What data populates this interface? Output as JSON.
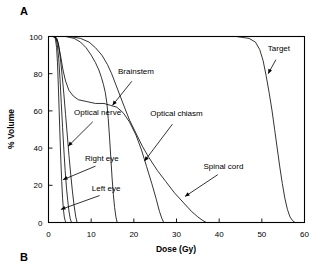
{
  "figure": {
    "panel_a_label": "A",
    "panel_b_label": "B"
  },
  "chart_data": {
    "type": "line",
    "title": "",
    "xlabel": "Dose (Gy)",
    "ylabel": "% Volume",
    "xlim": [
      0,
      60
    ],
    "ylim": [
      0,
      100
    ],
    "xticks": [
      0,
      10,
      20,
      30,
      40,
      50,
      60
    ],
    "yticks": [
      0,
      20,
      40,
      60,
      80,
      100
    ],
    "grid": false,
    "legend_position": "inline-annotations",
    "annotations": [
      {
        "label": "Target",
        "x": 54.0,
        "y": 92
      },
      {
        "label": "Brainstem",
        "x": 20.5,
        "y": 80
      },
      {
        "label": "Optical chiasm",
        "x": 30.0,
        "y": 57
      },
      {
        "label": "Optical nerve",
        "x": 11.5,
        "y": 58
      },
      {
        "label": "Right eye",
        "x": 12.5,
        "y": 33
      },
      {
        "label": "Left eye",
        "x": 13.5,
        "y": 17
      },
      {
        "label": "Spinal cord",
        "x": 41.0,
        "y": 29
      }
    ],
    "series": [
      {
        "name": "Left eye",
        "points": [
          [
            0,
            100
          ],
          [
            1.0,
            100
          ],
          [
            1.6,
            99
          ],
          [
            1.9,
            94
          ],
          [
            2.1,
            86
          ],
          [
            2.3,
            74
          ],
          [
            2.5,
            60
          ],
          [
            2.7,
            46
          ],
          [
            2.9,
            33
          ],
          [
            3.1,
            22
          ],
          [
            3.3,
            13
          ],
          [
            3.5,
            7
          ],
          [
            3.7,
            3
          ],
          [
            3.9,
            1
          ],
          [
            4.1,
            0
          ]
        ]
      },
      {
        "name": "Right eye",
        "points": [
          [
            0,
            100
          ],
          [
            1.2,
            100
          ],
          [
            1.8,
            99
          ],
          [
            2.1,
            95
          ],
          [
            2.4,
            88
          ],
          [
            2.7,
            77
          ],
          [
            3.0,
            64
          ],
          [
            3.3,
            51
          ],
          [
            3.6,
            39
          ],
          [
            3.9,
            28
          ],
          [
            4.2,
            19
          ],
          [
            4.5,
            12
          ],
          [
            4.8,
            6
          ],
          [
            5.1,
            2
          ],
          [
            5.4,
            0
          ]
        ]
      },
      {
        "name": "Optical nerve",
        "points": [
          [
            0,
            100
          ],
          [
            1.4,
            100
          ],
          [
            2.0,
            99
          ],
          [
            2.4,
            95
          ],
          [
            2.8,
            88
          ],
          [
            3.2,
            79
          ],
          [
            3.6,
            69
          ],
          [
            4.0,
            58
          ],
          [
            4.4,
            47
          ],
          [
            4.8,
            36
          ],
          [
            5.2,
            26
          ],
          [
            5.6,
            17
          ],
          [
            6.0,
            9
          ],
          [
            6.4,
            3
          ],
          [
            6.7,
            0
          ]
        ]
      },
      {
        "name": "Optical chiasm",
        "points": [
          [
            0,
            100
          ],
          [
            1.5,
            100
          ],
          [
            2.2,
            97
          ],
          [
            2.8,
            90
          ],
          [
            3.4,
            82
          ],
          [
            4.0,
            76
          ],
          [
            4.8,
            71
          ],
          [
            5.8,
            68
          ],
          [
            7.0,
            66
          ],
          [
            9.0,
            65
          ],
          [
            11.0,
            64
          ],
          [
            13.0,
            64
          ],
          [
            14.5,
            63
          ],
          [
            16.0,
            62
          ],
          [
            17.5,
            59
          ],
          [
            19.0,
            54
          ],
          [
            20.5,
            47
          ],
          [
            21.8,
            39
          ],
          [
            23.0,
            30
          ],
          [
            24.2,
            21
          ],
          [
            25.2,
            13
          ],
          [
            26.0,
            6
          ],
          [
            26.6,
            2
          ],
          [
            27.0,
            0
          ]
        ]
      },
      {
        "name": "Brainstem",
        "points": [
          [
            0,
            100
          ],
          [
            4.0,
            100
          ],
          [
            6.0,
            99
          ],
          [
            7.5,
            97
          ],
          [
            8.8,
            94
          ],
          [
            10.0,
            90
          ],
          [
            11.0,
            86
          ],
          [
            11.8,
            82
          ],
          [
            12.4,
            78
          ],
          [
            12.9,
            74
          ],
          [
            13.3,
            70
          ],
          [
            13.7,
            64
          ],
          [
            14.0,
            56
          ],
          [
            14.3,
            46
          ],
          [
            14.6,
            35
          ],
          [
            14.9,
            24
          ],
          [
            15.2,
            15
          ],
          [
            15.5,
            8
          ],
          [
            15.8,
            3
          ],
          [
            16.1,
            0
          ]
        ]
      },
      {
        "name": "Spinal cord",
        "points": [
          [
            0,
            100
          ],
          [
            5.0,
            100
          ],
          [
            7.5,
            99
          ],
          [
            9.5,
            97
          ],
          [
            11.0,
            94
          ],
          [
            12.5,
            90
          ],
          [
            13.8,
            85
          ],
          [
            14.8,
            80
          ],
          [
            15.8,
            74
          ],
          [
            16.8,
            68
          ],
          [
            17.8,
            62
          ],
          [
            19.0,
            55
          ],
          [
            20.5,
            48
          ],
          [
            22.0,
            41
          ],
          [
            23.5,
            35
          ],
          [
            25.5,
            28
          ],
          [
            27.5,
            22
          ],
          [
            29.5,
            16
          ],
          [
            31.5,
            11
          ],
          [
            33.5,
            6
          ],
          [
            35.0,
            3
          ],
          [
            36.2,
            1
          ],
          [
            37.0,
            0
          ]
        ]
      },
      {
        "name": "Target",
        "points": [
          [
            0,
            100
          ],
          [
            20,
            100
          ],
          [
            35,
            100
          ],
          [
            44,
            100
          ],
          [
            47,
            99
          ],
          [
            48.5,
            97
          ],
          [
            49.5,
            93
          ],
          [
            50.3,
            87
          ],
          [
            51.0,
            79
          ],
          [
            51.7,
            70
          ],
          [
            52.4,
            60
          ],
          [
            53.0,
            50
          ],
          [
            53.6,
            40
          ],
          [
            54.2,
            30
          ],
          [
            54.8,
            21
          ],
          [
            55.4,
            13
          ],
          [
            56.0,
            7
          ],
          [
            56.6,
            3
          ],
          [
            57.2,
            1
          ],
          [
            57.8,
            0
          ]
        ]
      }
    ]
  }
}
